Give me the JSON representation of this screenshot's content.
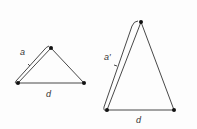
{
  "diagram": {
    "small_triangle": {
      "side_label": "a",
      "base_label": "d"
    },
    "large_triangle": {
      "side_label": "a′",
      "base_label": "d"
    },
    "colors": {
      "line": "#333333",
      "vertex": "#111111"
    }
  }
}
